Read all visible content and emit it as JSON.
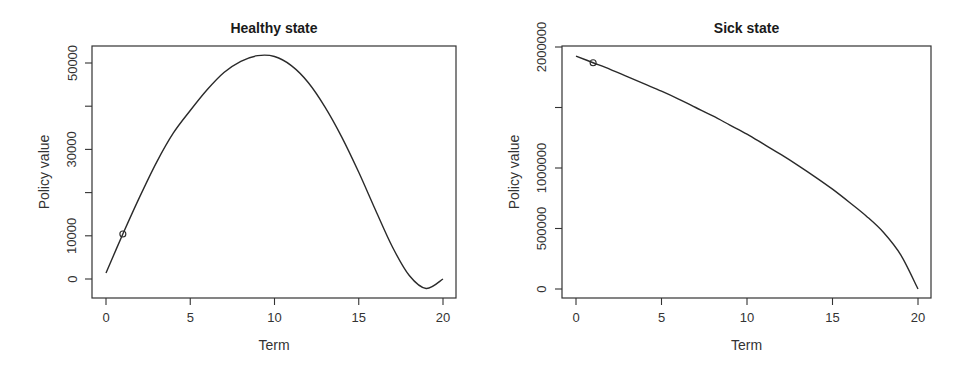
{
  "chart_data": [
    {
      "type": "line",
      "title": "Healthy state",
      "xlabel": "Term",
      "ylabel": "Policy value",
      "xlim": [
        0,
        20
      ],
      "ylim": [
        -3000,
        53000
      ],
      "x_ticks": [
        0,
        5,
        10,
        15,
        20
      ],
      "y_ticks": [
        0,
        10000,
        20000,
        30000,
        40000,
        50000
      ],
      "y_tick_labels": [
        "0",
        "10000",
        "",
        "30000",
        "",
        "50000"
      ],
      "grid": false,
      "series": [
        {
          "name": "Healthy state policy value",
          "x": [
            0,
            1,
            2,
            3,
            4,
            5,
            6,
            7,
            8,
            9,
            10,
            11,
            12,
            13,
            14,
            15,
            16,
            17,
            18,
            19,
            20
          ],
          "values": [
            1400,
            10400,
            19000,
            27000,
            33800,
            39000,
            43800,
            47800,
            50400,
            51700,
            51500,
            49400,
            45500,
            39800,
            32800,
            24700,
            15900,
            7400,
            800,
            -2200,
            0
          ]
        }
      ],
      "markers": [
        {
          "x": 1,
          "y": 10400,
          "shape": "open-circle"
        }
      ]
    },
    {
      "type": "line",
      "title": "Sick state",
      "xlabel": "Term",
      "ylabel": "Policy value",
      "xlim": [
        0,
        20
      ],
      "ylim": [
        -70000,
        2010000
      ],
      "x_ticks": [
        0,
        5,
        10,
        15,
        20
      ],
      "y_ticks": [
        0,
        500000,
        1000000,
        1500000,
        2000000
      ],
      "y_tick_labels": [
        "0",
        "500000",
        "1000000",
        "",
        "2000000"
      ],
      "grid": false,
      "series": [
        {
          "name": "Sick state policy value",
          "x": [
            0,
            1,
            2,
            3,
            4,
            5,
            6,
            7,
            8,
            9,
            10,
            11,
            12,
            13,
            14,
            15,
            16,
            17,
            18,
            19,
            20
          ],
          "values": [
            1925000,
            1870000,
            1815000,
            1755000,
            1695000,
            1635000,
            1570000,
            1500000,
            1430000,
            1355000,
            1280000,
            1195000,
            1110000,
            1020000,
            925000,
            825000,
            715000,
            600000,
            465000,
            280000,
            0
          ]
        }
      ],
      "markers": [
        {
          "x": 1,
          "y": 1870000,
          "shape": "open-circle"
        }
      ]
    }
  ]
}
